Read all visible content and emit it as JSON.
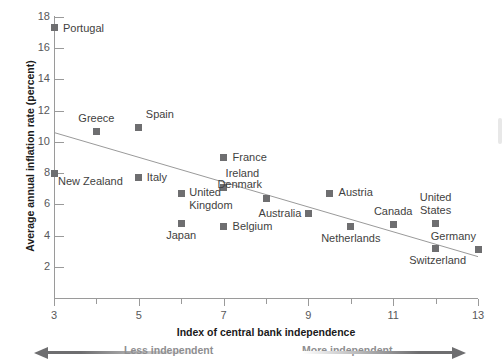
{
  "chart_data": {
    "type": "scatter",
    "title": "",
    "xlabel": "Index of central bank independence",
    "ylabel": "Average annual inflation rate (percent)",
    "xlim": [
      3,
      13
    ],
    "ylim": [
      0,
      18
    ],
    "xticks": [
      3,
      5,
      7,
      9,
      11,
      13
    ],
    "yticks": [
      2,
      4,
      6,
      8,
      10,
      12,
      14,
      16,
      18
    ],
    "grid": false,
    "legend": null,
    "points": [
      {
        "label": "Portugal",
        "x": 3.0,
        "y": 17.3,
        "label_pos": "right"
      },
      {
        "label": "Greece",
        "x": 4.0,
        "y": 10.65,
        "label_pos": "above"
      },
      {
        "label": "Spain",
        "x": 5.0,
        "y": 10.9,
        "label_pos": "above-right"
      },
      {
        "label": "New Zealand",
        "x": 3.0,
        "y": 8.0,
        "label_pos": "right"
      },
      {
        "label": "Italy",
        "x": 5.0,
        "y": 7.7,
        "label_pos": "right"
      },
      {
        "label": "France",
        "x": 7.0,
        "y": 9.0,
        "label_pos": "right"
      },
      {
        "label": "Ireland",
        "x": 7.0,
        "y": 7.1,
        "label_pos": "above-right"
      },
      {
        "label": "United\nKingdom",
        "x": 6.0,
        "y": 6.7,
        "label_pos": "right"
      },
      {
        "label": "Denmark",
        "x": 8.0,
        "y": 6.4,
        "label_pos": "above-right"
      },
      {
        "label": "Austria",
        "x": 9.5,
        "y": 6.7,
        "label_pos": "right"
      },
      {
        "label": "Japan",
        "x": 6.0,
        "y": 4.8,
        "label_pos": "below"
      },
      {
        "label": "Belgium",
        "x": 7.0,
        "y": 4.55,
        "label_pos": "right"
      },
      {
        "label": "Australia",
        "x": 9.0,
        "y": 5.4,
        "label_pos": "left-above"
      },
      {
        "label": "Netherlands",
        "x": 10.0,
        "y": 4.6,
        "label_pos": "below"
      },
      {
        "label": "Canada",
        "x": 11.0,
        "y": 4.7,
        "label_pos": "above"
      },
      {
        "label": "United\nStates",
        "x": 12.0,
        "y": 4.8,
        "label_pos": "above"
      },
      {
        "label": "Switzerland",
        "x": 12.0,
        "y": 3.2,
        "label_pos": "below-left"
      },
      {
        "label": "Germany",
        "x": 13.0,
        "y": 3.1,
        "label_pos": "above-left"
      }
    ],
    "trendline": {
      "x0": 3,
      "y0": 10.6,
      "x1": 13,
      "y1": 2.65
    }
  },
  "annotations": {
    "less_independent": "Less independent",
    "more_independent": "More independent"
  },
  "colors": {
    "marker": "#6e6e70",
    "axis": "#9a9a9a",
    "text": "#3f3f41",
    "title": "#1a1a1a",
    "annotation": "#8e8e90"
  }
}
